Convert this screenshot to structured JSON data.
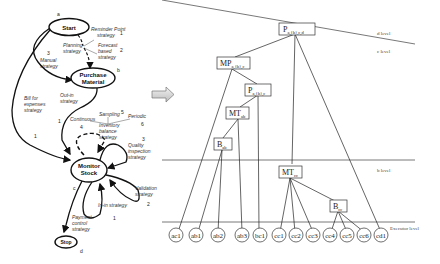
{
  "left_diagram": {
    "states": [
      {
        "id": "start",
        "label": "Start",
        "tag": "a"
      },
      {
        "id": "purchase",
        "label_lines": [
          "Purchase",
          "Material"
        ],
        "tag": "b"
      },
      {
        "id": "monitor",
        "label_lines": [
          "Monitor",
          "Stock"
        ],
        "tag": "c"
      },
      {
        "id": "stop",
        "label": "Stop",
        "tag": "d"
      }
    ],
    "strategies": {
      "reminder_line1": "Reminder Point",
      "reminder_line2": "strategy",
      "reminder_num": "1",
      "forecast_line1": "Forecast",
      "forecast_line2": "based",
      "forecast_line3": "strategy",
      "forecast_num": "2",
      "planning_line1": "Planning",
      "planning_line2": "strategy",
      "manual_num": "3",
      "manual_line1": "Manual",
      "manual_line2": "strategy",
      "bill_line1": "Bill for",
      "bill_line2": "expenses",
      "bill_line3": "strategy",
      "bill_num": "1",
      "outin_line1": "Out-in",
      "outin_line2": "strategy",
      "outin_num": "1",
      "sampling": "Sampling",
      "sampling_num": "5",
      "continuous": "Continuous",
      "continuous_num": "4",
      "periodic": "Periodic",
      "periodic_num": "6",
      "inventory_line1": "Inventory",
      "inventory_line2": "balance",
      "inventory_line3": "strategy",
      "quality_num": "3",
      "quality_line1": "Quality",
      "quality_line2": "inspection",
      "quality_line3": "strategy",
      "validation_line1": "Validation",
      "validation_line2": "strategy",
      "validation_num": "2",
      "inin": "In-in strategy",
      "inin_num": "1",
      "payment_line1": "Payment",
      "payment_line2": "control",
      "payment_line3": "strategy"
    }
  },
  "arrow": {
    "direction": "right"
  },
  "right_diagram": {
    "levels": {
      "d": "d level",
      "c": "c level",
      "b": "b level",
      "executor": "Executor level"
    },
    "boxes": {
      "p_top": {
        "main": "P",
        "sub": "a,{b},c,d"
      },
      "mp": {
        "main": "MP",
        "sub": "a,{b},c"
      },
      "p_mid": {
        "main": "P",
        "sub": "a,{b},c"
      },
      "mt_ab": {
        "main": "MT",
        "sub": "ab"
      },
      "b_ab": {
        "main": "B",
        "sub": "ab"
      },
      "mt_cc": {
        "main": "MT",
        "sub": "cc"
      },
      "b_cc": {
        "main": "B",
        "sub": "cc"
      }
    },
    "leaves": [
      "ac1",
      "ab1",
      "ab2",
      "ab3",
      "bc1",
      "cc1",
      "cc2",
      "cc3",
      "cc4",
      "cc5",
      "cc6",
      "cd1"
    ]
  }
}
